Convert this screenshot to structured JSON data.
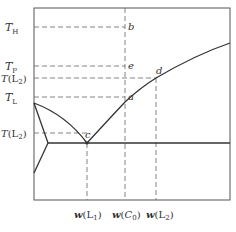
{
  "diagram": {
    "type": "phase-diagram",
    "y_labels": {
      "TH": {
        "main": "T",
        "sub": "H"
      },
      "TP": {
        "main": "T",
        "sub": "P"
      },
      "TL2_upper": {
        "main": "T",
        "paren_open": "(L",
        "sub": "2",
        "paren_close": ")"
      },
      "TL": {
        "main": "T",
        "sub": "L"
      },
      "TL2_lower": {
        "main": "T",
        "paren_open": "(L",
        "sub": "2",
        "paren_close": ")"
      }
    },
    "points": {
      "b": "b",
      "e": "e",
      "d": "d",
      "a": "a",
      "c": "c"
    },
    "x_labels": {
      "wL1": {
        "main": "w",
        "paren_open": "(L",
        "sub": "1",
        "paren_close": ")"
      },
      "wC0": {
        "main": "w",
        "paren_open": "(",
        "mid": "C",
        "sub": "0",
        "paren_close": ")"
      },
      "wL2": {
        "main": "w",
        "paren_open": "(L",
        "sub": "2",
        "paren_close": ")"
      }
    },
    "colors": {
      "line": "#333333",
      "frame": "#555555",
      "dash": "#666666"
    }
  }
}
